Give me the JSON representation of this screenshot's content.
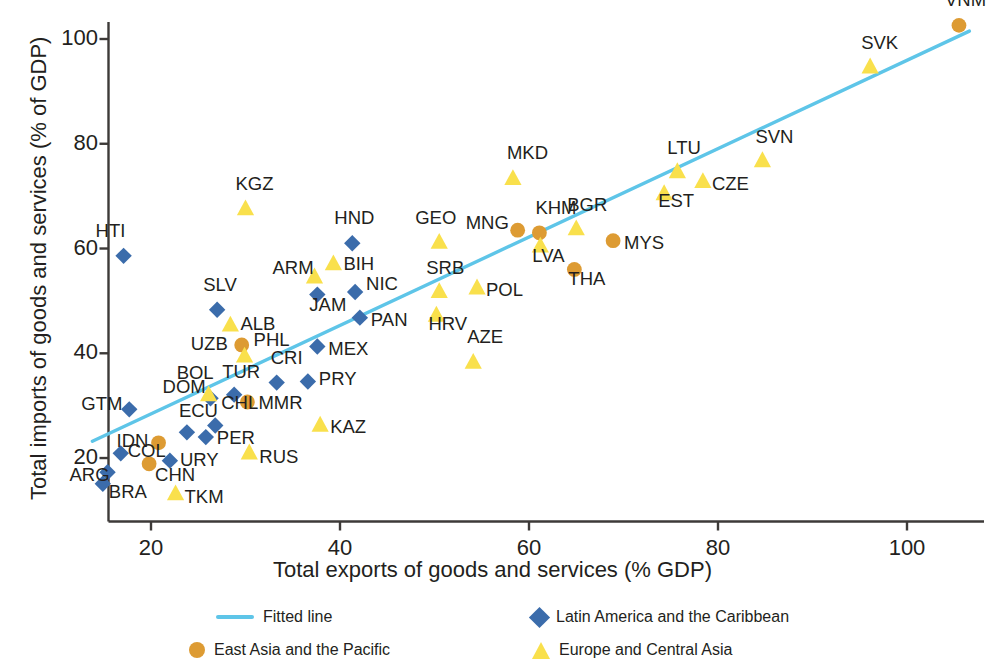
{
  "chart_data": {
    "type": "scatter",
    "title": "",
    "xlabel": "Total exports of goods and services (% GDP)",
    "ylabel": "Total imports of goods and services (% of GDP)",
    "xlim": [
      13,
      110
    ],
    "ylim": [
      11,
      106
    ],
    "xticks": [
      20,
      40,
      60,
      80,
      100
    ],
    "yticks": [
      20,
      40,
      60,
      80,
      100
    ],
    "grid": false,
    "legend_position": "bottom",
    "colors": {
      "fitted_line": "#5ec5e8",
      "latin_america": "#3b6cab",
      "east_asia": "#dd9b33",
      "europe_central_asia": "#f9e04c",
      "axis": "#3d3a38",
      "text": "#231f20"
    },
    "fitted_line": {
      "x0": 13.8,
      "y0": 23.2,
      "x1": 106.6,
      "y1": 101.5
    },
    "series": [
      {
        "name": "Latin America and the Caribbean",
        "marker": "diamond",
        "color": "#3b6cab",
        "points": [
          {
            "code": "HTI",
            "x": 17.1,
            "y": 58.6,
            "lx": -28,
            "ly": -26
          },
          {
            "code": "HND",
            "x": 41.3,
            "y": 61.0,
            "lx": -18,
            "ly": -26
          },
          {
            "code": "NIC",
            "x": 41.6,
            "y": 51.7,
            "lx": 11,
            "ly": -9
          },
          {
            "code": "PAN",
            "x": 42.1,
            "y": 46.8,
            "lx": 11,
            "ly": 1
          },
          {
            "code": "JAM",
            "x": 37.6,
            "y": 51.2,
            "lx": -8,
            "ly": 9
          },
          {
            "code": "SLV",
            "x": 27.0,
            "y": 48.3,
            "lx": -14,
            "ly": -26
          },
          {
            "code": "MEX",
            "x": 37.6,
            "y": 41.3,
            "lx": 11,
            "ly": 2
          },
          {
            "code": "CRI",
            "x": 33.3,
            "y": 34.4,
            "lx": -6,
            "ly": -26
          },
          {
            "code": "PRY",
            "x": 36.6,
            "y": 34.6,
            "lx": 11,
            "ly": -4
          },
          {
            "code": "TUR",
            "x": 28.8,
            "y": 32.1,
            "lx": -12,
            "ly": -24
          },
          {
            "code": "DOM",
            "x": 26.3,
            "y": 31.4,
            "lx": -48,
            "ly": -12
          },
          {
            "code": "GTM",
            "x": 17.7,
            "y": 29.3,
            "lx": -48,
            "ly": -6
          },
          {
            "code": "CHL",
            "x": 26.8,
            "y": 26.2,
            "lx": 6,
            "ly": -24
          },
          {
            "code": "PER",
            "x": 25.8,
            "y": 24.0,
            "lx": 11,
            "ly": 0
          },
          {
            "code": "ECU",
            "x": 23.8,
            "y": 24.9,
            "lx": -8,
            "ly": -22
          },
          {
            "code": "COL",
            "x": 16.8,
            "y": 20.9,
            "lx": 7,
            "ly": -3
          },
          {
            "code": "URY",
            "x": 22.0,
            "y": 19.5,
            "lx": 10,
            "ly": -2
          },
          {
            "code": "ARG",
            "x": 15.4,
            "y": 17.3,
            "lx": -38,
            "ly": 2
          },
          {
            "code": "BRA",
            "x": 14.9,
            "y": 15.1,
            "lx": 6,
            "ly": 7
          }
        ]
      },
      {
        "name": "East Asia and the Pacific",
        "marker": "circle",
        "color": "#dd9b33",
        "points": [
          {
            "code": "VNM",
            "x": 105.5,
            "y": 102.6,
            "lx": -14,
            "ly": -26
          },
          {
            "code": "MNG",
            "x": 58.8,
            "y": 63.5,
            "lx": -52,
            "ly": -8
          },
          {
            "code": "KHM",
            "x": 61.1,
            "y": 63.0,
            "lx": -4,
            "ly": -26
          },
          {
            "code": "MYS",
            "x": 68.9,
            "y": 61.5,
            "lx": 11,
            "ly": 1
          },
          {
            "code": "THA",
            "x": 64.8,
            "y": 56.0,
            "lx": -6,
            "ly": 9
          },
          {
            "code": "UZB",
            "x": 29.6,
            "y": 41.6,
            "lx": -51,
            "ly": -2
          },
          {
            "code": "MMR",
            "x": 30.2,
            "y": 30.7,
            "lx": 11,
            "ly": 0
          },
          {
            "code": "IDN",
            "x": 20.8,
            "y": 22.9,
            "lx": -42,
            "ly": -3
          },
          {
            "code": "CHN",
            "x": 19.8,
            "y": 18.9,
            "lx": 6,
            "ly": 10
          }
        ]
      },
      {
        "name": "Europe and Central Asia",
        "marker": "triangle",
        "color": "#f9e04c",
        "points": [
          {
            "code": "SVK",
            "x": 96.1,
            "y": 94.7,
            "lx": -9,
            "ly": -25
          },
          {
            "code": "SVN",
            "x": 84.7,
            "y": 76.8,
            "lx": -7,
            "ly": -25
          },
          {
            "code": "CZE",
            "x": 78.4,
            "y": 72.8,
            "lx": 9,
            "ly": 2
          },
          {
            "code": "LTU",
            "x": 75.7,
            "y": 74.7,
            "lx": -10,
            "ly": -25
          },
          {
            "code": "EST",
            "x": 74.3,
            "y": 70.5,
            "lx": -6,
            "ly": 6
          },
          {
            "code": "MKD",
            "x": 58.3,
            "y": 73.4,
            "lx": -6,
            "ly": -26
          },
          {
            "code": "BGR",
            "x": 65.0,
            "y": 63.8,
            "lx": -9,
            "ly": -25
          },
          {
            "code": "GEO",
            "x": 50.5,
            "y": 61.2,
            "lx": -24,
            "ly": -25
          },
          {
            "code": "SRB",
            "x": 50.5,
            "y": 51.8,
            "lx": -13,
            "ly": -24
          },
          {
            "code": "LVA",
            "x": 61.2,
            "y": 60.5,
            "lx": -8,
            "ly": 9
          },
          {
            "code": "POL",
            "x": 54.5,
            "y": 52.5,
            "lx": 9,
            "ly": 1
          },
          {
            "code": "HRV",
            "x": 50.2,
            "y": 47.3,
            "lx": -8,
            "ly": 8
          },
          {
            "code": "AZE",
            "x": 54.1,
            "y": 38.3,
            "lx": -6,
            "ly": -26
          },
          {
            "code": "KGZ",
            "x": 30.0,
            "y": 67.6,
            "lx": -10,
            "ly": -26
          },
          {
            "code": "BIH",
            "x": 39.3,
            "y": 57.1,
            "lx": 10,
            "ly": -1
          },
          {
            "code": "ARM",
            "x": 37.3,
            "y": 54.6,
            "lx": -42,
            "ly": -10
          },
          {
            "code": "ALB",
            "x": 28.4,
            "y": 45.4,
            "lx": 10,
            "ly": -2
          },
          {
            "code": "PHL",
            "x": 29.9,
            "y": 39.5,
            "lx": 9,
            "ly": -17
          },
          {
            "code": "BOL",
            "x": 26.1,
            "y": 32.1,
            "lx": -32,
            "ly": -23
          },
          {
            "code": "KAZ",
            "x": 37.9,
            "y": 26.3,
            "lx": 10,
            "ly": 1
          },
          {
            "code": "RUS",
            "x": 30.4,
            "y": 21.0,
            "lx": 10,
            "ly": 3
          },
          {
            "code": "TKM",
            "x": 22.6,
            "y": 13.2,
            "lx": 9,
            "ly": 2
          }
        ]
      }
    ],
    "legend": [
      {
        "label": "Fitted line",
        "marker": "line",
        "color": "#5ec5e8"
      },
      {
        "label": "Latin America and the Caribbean",
        "marker": "diamond",
        "color": "#3b6cab"
      },
      {
        "label": "East Asia and the Pacific",
        "marker": "circle",
        "color": "#dd9b33"
      },
      {
        "label": "Europe and Central Asia",
        "marker": "triangle",
        "color": "#f9e04c"
      }
    ]
  }
}
